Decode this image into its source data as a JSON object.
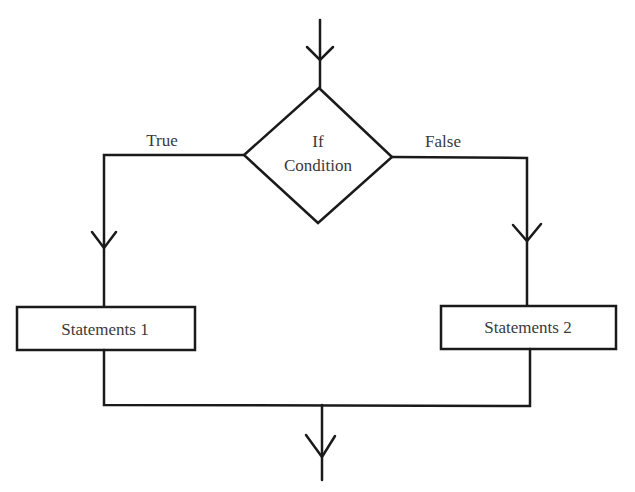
{
  "diagram": {
    "type": "flowchart",
    "decision": {
      "line1": "If",
      "line2": "Condition"
    },
    "branches": {
      "true_label": "True",
      "false_label": "False"
    },
    "boxes": [
      {
        "label": "Statements 1"
      },
      {
        "label": "Statements 2"
      }
    ],
    "colors": {
      "stroke": "#1a1a1a",
      "text": "#3a3a3a",
      "background": "#ffffff"
    }
  }
}
